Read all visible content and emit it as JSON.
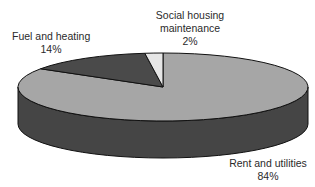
{
  "chart_data": {
    "type": "pie",
    "style": "3d",
    "title": "",
    "categories": [
      "Rent and utilities",
      "Fuel and heating",
      "Social housing maintenance"
    ],
    "values": [
      84,
      14,
      2
    ],
    "unit": "%",
    "colors": [
      "#a6a6a6",
      "#4a4a4a",
      "#e6e6e6"
    ],
    "side_color": "#454545",
    "legend": "none",
    "labels": [
      {
        "name": "Rent and utilities",
        "value": "84%"
      },
      {
        "name": "Fuel and heating",
        "value": "14%"
      },
      {
        "name": "Social housing maintenance",
        "name_lines": [
          "Social housing",
          "maintenance"
        ],
        "value": "2%"
      }
    ]
  },
  "labels": {
    "rent": {
      "line1": "Rent and utilities",
      "value": "84%"
    },
    "fuel": {
      "line1": "Fuel and heating",
      "value": "14%"
    },
    "social": {
      "line1": "Social housing",
      "line2": "maintenance",
      "value": "2%"
    }
  }
}
